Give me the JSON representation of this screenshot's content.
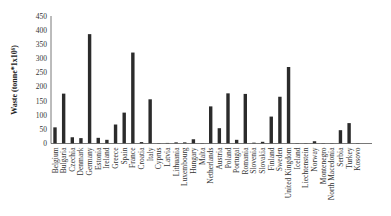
{
  "chart_data": {
    "type": "bar",
    "title": "",
    "xlabel": "",
    "ylabel": "Waste (tonne*1x10⁶)",
    "ylim": [
      0,
      450
    ],
    "yticks": [
      0,
      50,
      100,
      150,
      200,
      250,
      300,
      350,
      400,
      450
    ],
    "grid": false,
    "legend": "none",
    "categories": [
      "Belgium",
      "Bulgaria",
      "Czechia",
      "Denmark",
      "Germany",
      "Estonia",
      "Ireland",
      "Greece",
      "Spain",
      "France",
      "Croatia",
      "Italy",
      "Cyprus",
      "Latvia",
      "Lithuania",
      "Luxembourg",
      "Hungary",
      "Malta",
      "Netherlands",
      "Austria",
      "Poland",
      "Portugal",
      "Romania",
      "Slovenia",
      "Slovakia",
      "Finland",
      "Sweden",
      "United Kingdom",
      "Iceland",
      "Liechtenstein",
      "Norway",
      "Montenegro",
      "North Macedonia",
      "Serbia",
      "Turkey",
      "Kosovo"
    ],
    "values": [
      57,
      176,
      22,
      19,
      386,
      20,
      13,
      67,
      109,
      321,
      5,
      156,
      1,
      2,
      4,
      4,
      15,
      1,
      131,
      54,
      177,
      13,
      175,
      3,
      6,
      95,
      165,
      270,
      0.5,
      0.5,
      8,
      1,
      1,
      47,
      72,
      0.5
    ]
  }
}
